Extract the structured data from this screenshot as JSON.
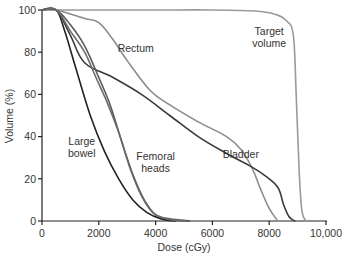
{
  "chart_data": {
    "type": "line",
    "title": "",
    "xlabel": "Dose (cGy)",
    "ylabel": "Volume (%)",
    "xlim": [
      0,
      10000
    ],
    "ylim": [
      0,
      100
    ],
    "x_ticks": [
      0,
      2000,
      4000,
      6000,
      8000,
      10000
    ],
    "x_tick_labels": [
      "0",
      "2000",
      "4000",
      "6000",
      "8000",
      "10,000"
    ],
    "y_ticks": [
      0,
      20,
      40,
      60,
      80,
      100
    ],
    "y_tick_labels": [
      "0",
      "20",
      "40",
      "60",
      "80",
      "100"
    ],
    "grid": false,
    "legend": "none (inline annotations)",
    "series": [
      {
        "name": "Target volume",
        "color": "#9a9a9a",
        "x": [
          0,
          2000,
          4000,
          6000,
          7500,
          8200,
          8600,
          8850,
          8950,
          9050,
          9150,
          9300
        ],
        "y": [
          100,
          100,
          100,
          100,
          99.5,
          98,
          95,
          88,
          60,
          25,
          5,
          0
        ]
      },
      {
        "name": "Rectum",
        "color": "#8c8c8c",
        "x": [
          0,
          500,
          1500,
          2000,
          2500,
          3000,
          3800,
          4500,
          5500,
          6500,
          7000,
          7400,
          7700,
          8000,
          8300
        ],
        "y": [
          100,
          100,
          96,
          94,
          86,
          76,
          62,
          55,
          47,
          40,
          34,
          25,
          15,
          6,
          0
        ]
      },
      {
        "name": "Bladder",
        "color": "#3a3a3a",
        "x": [
          0,
          500,
          1000,
          1500,
          2500,
          3500,
          4500,
          5500,
          6500,
          7200,
          7800,
          8300,
          8500,
          8700,
          8900
        ],
        "y": [
          100,
          100,
          88,
          75,
          68,
          60,
          50,
          40,
          32,
          27,
          22,
          16,
          8,
          2,
          0
        ]
      },
      {
        "name": "Large bowel",
        "color": "#222222",
        "x": [
          0,
          500,
          800,
          1200,
          1700,
          2200,
          2700,
          3200,
          3700,
          4200,
          4700
        ],
        "y": [
          100,
          100,
          90,
          72,
          50,
          33,
          20,
          10,
          4,
          1,
          0
        ]
      },
      {
        "name": "Femoral heads (1)",
        "color": "#5a5a5a",
        "x": [
          0,
          500,
          1000,
          1500,
          2000,
          2400,
          2800,
          3200,
          3600,
          4000,
          4500,
          5200
        ],
        "y": [
          100,
          100,
          93,
          83,
          68,
          55,
          38,
          22,
          10,
          3,
          1,
          0
        ]
      },
      {
        "name": "Femoral heads (2)",
        "color": "#6a6a6a",
        "x": [
          0,
          500,
          1000,
          1500,
          1900,
          2300,
          2700,
          3100,
          3500,
          3900,
          4400,
          5000
        ],
        "y": [
          100,
          100,
          90,
          80,
          68,
          56,
          42,
          25,
          12,
          4,
          1,
          0
        ]
      }
    ],
    "annotations": [
      {
        "text_lines": [
          "Target",
          "volume"
        ],
        "near_x": 8000,
        "near_y": 88
      },
      {
        "text_lines": [
          "Rectum"
        ],
        "near_x": 3300,
        "near_y": 80
      },
      {
        "text_lines": [
          "Bladder"
        ],
        "near_x": 7000,
        "near_y": 30
      },
      {
        "text_lines": [
          "Large",
          "bowel"
        ],
        "near_x": 1400,
        "near_y": 36
      },
      {
        "text_lines": [
          "Femoral",
          "heads"
        ],
        "near_x": 4000,
        "near_y": 29
      }
    ]
  }
}
